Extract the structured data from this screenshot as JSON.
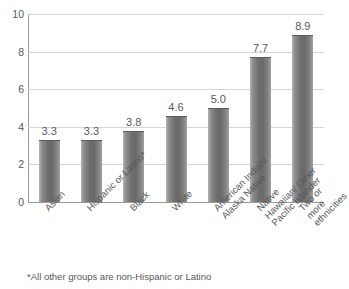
{
  "chart_data": {
    "type": "bar",
    "title": "",
    "xlabel": "",
    "ylabel": "",
    "ylim": [
      0,
      10
    ],
    "yticks": [
      "0",
      "2",
      "4",
      "6",
      "8",
      "10"
    ],
    "grid": true,
    "legend": null,
    "categories": [
      "Asian",
      "Hispanic or Latino*",
      "Black",
      "White",
      "American Indian/\nAlaska Native",
      "Native Hawaiian/ Other\nPacific Islander",
      "Two or more\nethnicities"
    ],
    "values": [
      3.3,
      3.3,
      3.8,
      4.6,
      5.0,
      7.7,
      8.9
    ],
    "value_labels": [
      "3.3",
      "3.3",
      "3.8",
      "4.6",
      "5.0",
      "7.7",
      "8.9"
    ],
    "annotations": [
      "*All other groups are non-Hispanic or Latino"
    ],
    "bar_color": "#6d6d6d",
    "grid_color": "#d6d6d6",
    "axis_color": "#9a9a9a",
    "text_color": "#58585a",
    "background": "#ffffff"
  },
  "footnote": "*All other groups are non-Hispanic or Latino"
}
